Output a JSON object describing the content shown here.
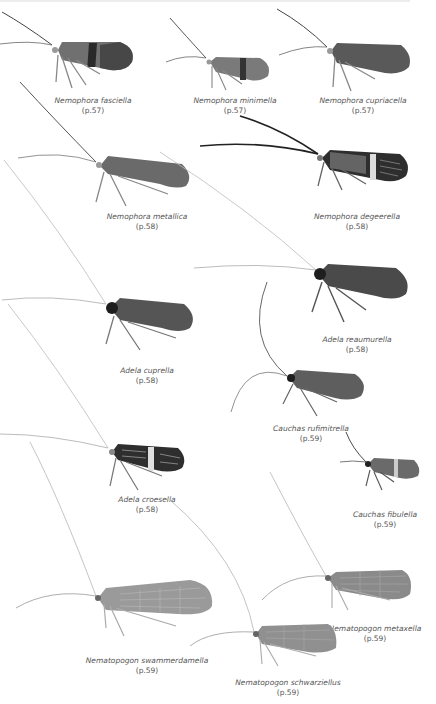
{
  "plate": {
    "specimens": [
      {
        "id": "fasciella",
        "name": "Nemophora fasciella",
        "page": "(p.57)",
        "pattern": "banded",
        "color": "#6e6e6e"
      },
      {
        "id": "minimella",
        "name": "Nemophora minimella",
        "page": "(p.57)",
        "pattern": "banded",
        "color": "#7a7a7a"
      },
      {
        "id": "cupriacella",
        "name": "Nemophora cupriacella",
        "page": "(p.57)",
        "pattern": "plain",
        "color": "#5a5a5a"
      },
      {
        "id": "metallica",
        "name": "Nemophora metallica",
        "page": "(p.58)",
        "pattern": "plain",
        "color": "#6a6a6a"
      },
      {
        "id": "degeerella",
        "name": "Nemophora degeerella",
        "page": "(p.58)",
        "pattern": "striped-banded",
        "color": "#333333"
      },
      {
        "id": "reaumurella",
        "name": "Adela reaumurella",
        "page": "(p.58)",
        "pattern": "plain",
        "color": "#4a4a4a"
      },
      {
        "id": "cuprella",
        "name": "Adela cuprella",
        "page": "(p.58)",
        "pattern": "plain",
        "color": "#555555"
      },
      {
        "id": "rufimitrella",
        "name": "Cauchas rufimitrella",
        "page": "(p.59)",
        "pattern": "plain",
        "color": "#5e5e5e"
      },
      {
        "id": "croesella",
        "name": "Adela croesella",
        "page": "(p.58)",
        "pattern": "striped-banded",
        "color": "#3a3a3a"
      },
      {
        "id": "fibulella",
        "name": "Cauchas fibulella",
        "page": "(p.59)",
        "pattern": "banded",
        "color": "#6a6a6a"
      },
      {
        "id": "swammerdamella",
        "name": "Nematopogon swammerdamella",
        "page": "(p.59)",
        "pattern": "reticulate",
        "color": "#9a9a9a"
      },
      {
        "id": "metaxella",
        "name": "Nematopogon metaxella",
        "page": "(p.59)",
        "pattern": "reticulate",
        "color": "#8a8a8a"
      },
      {
        "id": "schwarziellus",
        "name": "Nematopogon schwarziellus",
        "page": "(p.59)",
        "pattern": "reticulate",
        "color": "#909090"
      }
    ]
  }
}
